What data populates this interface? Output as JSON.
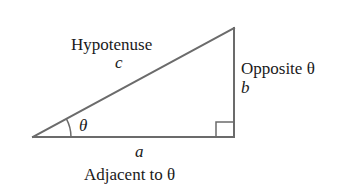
{
  "diagram": {
    "colors": {
      "line": "#6b6b6b",
      "text": "#1a1a1a",
      "background": "#ffffff"
    },
    "vertices": {
      "angle_vertex": [
        33,
        137
      ],
      "top_vertex": [
        234,
        28
      ],
      "right_angle_vertex": [
        234,
        137
      ]
    },
    "sides": {
      "hypotenuse": {
        "label": "Hypotenuse",
        "variable": "c"
      },
      "opposite": {
        "label": "Opposite θ",
        "variable": "b"
      },
      "adjacent": {
        "label": "Adjacent to θ",
        "variable": "a"
      }
    },
    "angle": {
      "symbol": "θ"
    },
    "right_angle_marker": true
  }
}
